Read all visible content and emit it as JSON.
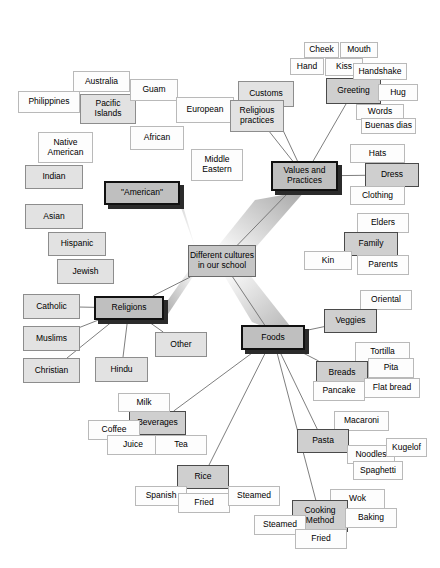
{
  "diagram": {
    "type": "mind-map",
    "center": {
      "label": "Different cultures\nin our school",
      "x": 188,
      "y": 245,
      "w": 68,
      "h": 32
    },
    "ray_color": "#b0b0b0",
    "edge_color": "#6f6f6f",
    "branches": [
      {
        "label": "\"American\"",
        "x": 104,
        "y": 181,
        "w": 76,
        "h": 24,
        "children": [
          {
            "label": "Pacific\nIslands",
            "tier": "mid",
            "x": 80,
            "y": 94,
            "w": 56,
            "h": 30
          },
          {
            "label": "Australia",
            "tier": "leaf",
            "x": 73,
            "y": 71,
            "w": 57,
            "h": 21
          },
          {
            "label": "Guam",
            "tier": "leaf",
            "x": 130,
            "y": 79,
            "w": 48,
            "h": 22
          },
          {
            "label": "Philippines",
            "tier": "leaf",
            "x": 18,
            "y": 91,
            "w": 62,
            "h": 22
          },
          {
            "label": "African",
            "tier": "leaf",
            "x": 130,
            "y": 126,
            "w": 54,
            "h": 24
          },
          {
            "label": "European",
            "tier": "leaf",
            "x": 176,
            "y": 97,
            "w": 58,
            "h": 26
          },
          {
            "label": "Middle\nEastern",
            "tier": "leaf",
            "x": 191,
            "y": 149,
            "w": 52,
            "h": 32
          },
          {
            "label": "Native\nAmerican",
            "tier": "leaf",
            "x": 38,
            "y": 132,
            "w": 55,
            "h": 31
          },
          {
            "label": "Indian",
            "tier": "mid",
            "x": 25,
            "y": 165,
            "w": 58,
            "h": 24
          },
          {
            "label": "Asian",
            "tier": "mid",
            "x": 25,
            "y": 204,
            "w": 58,
            "h": 25
          },
          {
            "label": "Hispanic",
            "tier": "mid",
            "x": 48,
            "y": 232,
            "w": 58,
            "h": 24
          },
          {
            "label": "Jewish",
            "tier": "mid",
            "x": 57,
            "y": 259,
            "w": 57,
            "h": 25
          }
        ]
      },
      {
        "label": "Religions",
        "x": 94,
        "y": 296,
        "w": 70,
        "h": 24,
        "children": [
          {
            "label": "Catholic",
            "tier": "mid",
            "x": 23,
            "y": 294,
            "w": 57,
            "h": 25
          },
          {
            "label": "Muslims",
            "tier": "mid",
            "x": 23,
            "y": 326,
            "w": 57,
            "h": 25
          },
          {
            "label": "Christian",
            "tier": "mid",
            "x": 23,
            "y": 358,
            "w": 57,
            "h": 25
          },
          {
            "label": "Hindu",
            "tier": "mid",
            "x": 95,
            "y": 357,
            "w": 53,
            "h": 25
          },
          {
            "label": "Other",
            "tier": "mid",
            "x": 155,
            "y": 332,
            "w": 52,
            "h": 25
          }
        ]
      },
      {
        "label": "Values and\nPractices",
        "x": 271,
        "y": 161,
        "w": 67,
        "h": 30,
        "children": [
          {
            "label": "Customs",
            "tier": "mid",
            "x": 238,
            "y": 81,
            "w": 56,
            "h": 26
          },
          {
            "label": "Religious\npractices",
            "tier": "mid",
            "x": 230,
            "y": 100,
            "w": 54,
            "h": 32
          },
          {
            "label": "Greeting",
            "tier": "sub",
            "x": 326,
            "y": 78,
            "w": 55,
            "h": 26
          },
          {
            "label": "Cheek",
            "tier": "leaf",
            "x": 304,
            "y": 42,
            "w": 35,
            "h": 16
          },
          {
            "label": "Mouth",
            "tier": "leaf",
            "x": 340,
            "y": 42,
            "w": 38,
            "h": 16
          },
          {
            "label": "Hand",
            "tier": "leaf",
            "x": 290,
            "y": 58,
            "w": 34,
            "h": 17
          },
          {
            "label": "Kiss",
            "tier": "leaf",
            "x": 325,
            "y": 58,
            "w": 38,
            "h": 18
          },
          {
            "label": "Handshake",
            "tier": "leaf",
            "x": 353,
            "y": 63,
            "w": 54,
            "h": 17
          },
          {
            "label": "Hug",
            "tier": "leaf",
            "x": 378,
            "y": 84,
            "w": 40,
            "h": 17
          },
          {
            "label": "Words",
            "tier": "leaf",
            "x": 356,
            "y": 104,
            "w": 48,
            "h": 16
          },
          {
            "label": "Buenas dias",
            "tier": "leaf",
            "x": 361,
            "y": 118,
            "w": 55,
            "h": 16
          },
          {
            "label": "Hats",
            "tier": "leaf",
            "x": 350,
            "y": 144,
            "w": 55,
            "h": 19
          },
          {
            "label": "Dress",
            "tier": "sub",
            "x": 365,
            "y": 163,
            "w": 54,
            "h": 24
          },
          {
            "label": "Clothing",
            "tier": "leaf",
            "x": 350,
            "y": 186,
            "w": 55,
            "h": 19
          },
          {
            "label": "Elders",
            "tier": "leaf",
            "x": 357,
            "y": 213,
            "w": 52,
            "h": 20
          },
          {
            "label": "Family",
            "tier": "sub",
            "x": 344,
            "y": 232,
            "w": 54,
            "h": 24
          },
          {
            "label": "Kin",
            "tier": "leaf",
            "x": 304,
            "y": 251,
            "w": 48,
            "h": 19
          },
          {
            "label": "Parents",
            "tier": "leaf",
            "x": 357,
            "y": 255,
            "w": 52,
            "h": 20
          }
        ]
      },
      {
        "label": "Foods",
        "x": 241,
        "y": 325,
        "w": 64,
        "h": 25,
        "children": [
          {
            "label": "Oriental",
            "tier": "leaf",
            "x": 360,
            "y": 290,
            "w": 52,
            "h": 20
          },
          {
            "label": "Veggies",
            "tier": "sub",
            "x": 324,
            "y": 309,
            "w": 53,
            "h": 24
          },
          {
            "label": "Tortilla",
            "tier": "leaf",
            "x": 355,
            "y": 342,
            "w": 55,
            "h": 20
          },
          {
            "label": "Breads",
            "tier": "sub",
            "x": 316,
            "y": 361,
            "w": 52,
            "h": 24
          },
          {
            "label": "Pita",
            "tier": "leaf",
            "x": 368,
            "y": 358,
            "w": 46,
            "h": 20
          },
          {
            "label": "Pancake",
            "tier": "leaf",
            "x": 313,
            "y": 381,
            "w": 52,
            "h": 20
          },
          {
            "label": "Flat bread",
            "tier": "leaf",
            "x": 364,
            "y": 378,
            "w": 56,
            "h": 20
          },
          {
            "label": "Macaroni",
            "tier": "leaf",
            "x": 334,
            "y": 411,
            "w": 55,
            "h": 20
          },
          {
            "label": "Pasta",
            "tier": "sub",
            "x": 297,
            "y": 429,
            "w": 52,
            "h": 24
          },
          {
            "label": "Noodles",
            "tier": "leaf",
            "x": 347,
            "y": 445,
            "w": 48,
            "h": 19
          },
          {
            "label": "Kugelof",
            "tier": "leaf",
            "x": 386,
            "y": 438,
            "w": 41,
            "h": 19
          },
          {
            "label": "Spaghetti",
            "tier": "leaf",
            "x": 353,
            "y": 461,
            "w": 50,
            "h": 19
          },
          {
            "label": "Wok",
            "tier": "leaf",
            "x": 330,
            "y": 489,
            "w": 55,
            "h": 20
          },
          {
            "label": "Cooking\nMethod",
            "tier": "sub",
            "x": 292,
            "y": 500,
            "w": 56,
            "h": 32
          },
          {
            "label": "Baking",
            "tier": "leaf",
            "x": 345,
            "y": 508,
            "w": 52,
            "h": 20
          },
          {
            "label": "Steamed",
            "tier": "leaf",
            "x": 254,
            "y": 515,
            "w": 52,
            "h": 20
          },
          {
            "label": "Fried",
            "tier": "leaf",
            "x": 295,
            "y": 529,
            "w": 52,
            "h": 20
          },
          {
            "label": "Rice",
            "tier": "sub",
            "x": 177,
            "y": 465,
            "w": 52,
            "h": 24
          },
          {
            "label": "Spanish",
            "tier": "leaf",
            "x": 135,
            "y": 486,
            "w": 52,
            "h": 20
          },
          {
            "label": "Fried",
            "tier": "leaf",
            "x": 178,
            "y": 493,
            "w": 52,
            "h": 20
          },
          {
            "label": "Steamed",
            "tier": "leaf",
            "x": 228,
            "y": 486,
            "w": 52,
            "h": 20
          },
          {
            "label": "Beverages",
            "tier": "sub",
            "x": 129,
            "y": 411,
            "w": 57,
            "h": 24
          },
          {
            "label": "Milk",
            "tier": "leaf",
            "x": 118,
            "y": 393,
            "w": 52,
            "h": 19
          },
          {
            "label": "Coffee",
            "tier": "leaf",
            "x": 88,
            "y": 420,
            "w": 52,
            "h": 20
          },
          {
            "label": "Juice",
            "tier": "leaf",
            "x": 107,
            "y": 435,
            "w": 52,
            "h": 20
          },
          {
            "label": "Tea",
            "tier": "leaf",
            "x": 155,
            "y": 435,
            "w": 52,
            "h": 20
          }
        ]
      }
    ],
    "edges": [
      [
        "c",
        "American"
      ],
      [
        "c",
        "Religions"
      ],
      [
        "c",
        "Values and Practices"
      ],
      [
        "c",
        "Foods"
      ],
      [
        "American",
        "Pacific Islands"
      ],
      [
        "American",
        "African"
      ],
      [
        "American",
        "European"
      ],
      [
        "American",
        "Middle Eastern"
      ],
      [
        "American",
        "Native American"
      ],
      [
        "American",
        "Indian"
      ],
      [
        "American",
        "Asian"
      ],
      [
        "American",
        "Hispanic"
      ],
      [
        "American",
        "Jewish"
      ],
      [
        "Religions",
        "Catholic"
      ],
      [
        "Religions",
        "Muslims"
      ],
      [
        "Religions",
        "Christian"
      ],
      [
        "Religions",
        "Hindu"
      ],
      [
        "Religions",
        "Other"
      ],
      [
        "Values and Practices",
        "Customs"
      ],
      [
        "Values and Practices",
        "Religious practices"
      ],
      [
        "Values and Practices",
        "Greeting"
      ],
      [
        "Values and Practices",
        "Dress"
      ],
      [
        "Foods",
        "Veggies"
      ],
      [
        "Foods",
        "Breads"
      ],
      [
        "Foods",
        "Pasta"
      ],
      [
        "Foods",
        "Cooking Method"
      ],
      [
        "Foods",
        "Rice"
      ],
      [
        "Foods",
        "Beverages"
      ]
    ]
  }
}
